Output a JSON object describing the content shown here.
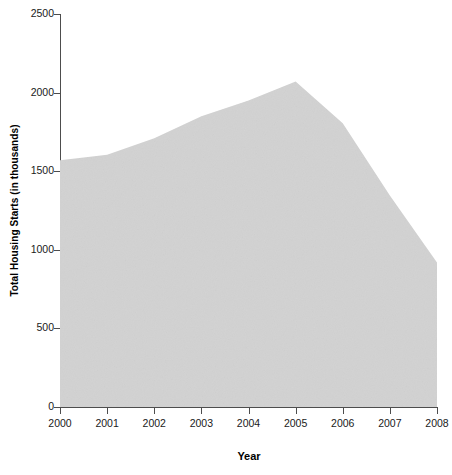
{
  "chart_data": {
    "type": "area",
    "title": "",
    "xlabel": "Year",
    "ylabel": "Total Housing Starts (in thousands)",
    "x": [
      2000,
      2001,
      2002,
      2003,
      2004,
      2005,
      2006,
      2007,
      2008
    ],
    "categories": [
      "2000",
      "2001",
      "2002",
      "2003",
      "2004",
      "2005",
      "2006",
      "2007",
      "2008"
    ],
    "values": [
      1570,
      1605,
      1710,
      1850,
      1950,
      2070,
      1805,
      1345,
      920
    ],
    "series": [
      {
        "name": "Total Housing Starts",
        "values": [
          1570,
          1605,
          1710,
          1850,
          1950,
          2070,
          1805,
          1345,
          920
        ]
      }
    ],
    "xlim": [
      2000,
      2008
    ],
    "ylim": [
      0,
      2500
    ],
    "ytick_values": [
      0,
      500,
      1000,
      1500,
      2000,
      2500
    ],
    "ytick_labels": [
      "0",
      "500",
      "1000",
      "1500",
      "2000",
      "2500"
    ],
    "xtick_labels": [
      "2000",
      "2001",
      "2002",
      "2003",
      "2004",
      "2005",
      "2006",
      "2007",
      "2008"
    ],
    "grid": false,
    "legend": false,
    "legend_position": "none",
    "fill_color": "#d2d2d2",
    "axis_color": "#4d4d4d",
    "text_color": "#1a1a1a",
    "background_color": "#ffffff"
  }
}
